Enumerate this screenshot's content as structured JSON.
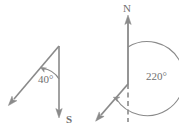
{
  "figure": {
    "background_color": "#ffffff",
    "stroke_color": "#8a8a8a",
    "text_color": "#707070",
    "diagrams": [
      {
        "id": "left-bearing-diagram",
        "name": "bearing-40-degrees",
        "labels": {
          "angle": "40°",
          "direction": "S"
        },
        "angle_value": 40,
        "reference_direction": "S",
        "reference_line": "solid",
        "vector_direction": "down-left"
      },
      {
        "id": "right-bearing-diagram",
        "name": "bearing-220-degrees",
        "labels": {
          "angle": "220°",
          "direction": "N"
        },
        "angle_value": 220,
        "reference_direction": "N",
        "reference_line": "dashed-south-solid-north",
        "vector_direction": "down-left"
      }
    ]
  }
}
